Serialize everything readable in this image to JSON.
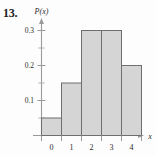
{
  "figure": {
    "problem_number": "13.",
    "y_axis_label": "P(x)",
    "x_axis_label": "x"
  },
  "chart_data": {
    "type": "bar",
    "title": "",
    "subtitle": "",
    "xlabel": "x",
    "ylabel": "P(x)",
    "categories": [
      "0",
      "1",
      "2",
      "3",
      "4"
    ],
    "values": [
      0.05,
      0.15,
      0.3,
      0.3,
      0.2
    ],
    "ylim": [
      0,
      0.35
    ],
    "xlim": [
      -0.5,
      4.5
    ],
    "y_ticks": [
      0.1,
      0.2,
      0.3
    ],
    "y_tick_labels": [
      "0.1",
      "0.2",
      "0.3"
    ],
    "y_minor_ticks": [
      0.05,
      0.15,
      0.25
    ],
    "x_ticks": [
      -0.5,
      0.5,
      1.5,
      2.5,
      3.5,
      4.5
    ],
    "x_tick_labels": [
      "0",
      "1",
      "2",
      "3",
      "4"
    ],
    "grid": false,
    "legend": false,
    "bar_fill": "#d5d5d5",
    "bar_stroke": "#6e6e6e",
    "axis_color": "#9a9a9a"
  }
}
